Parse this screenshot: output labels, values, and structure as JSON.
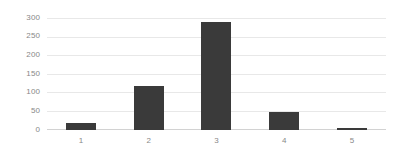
{
  "chart_data": {
    "type": "bar",
    "title": "",
    "subtitle": "",
    "xlabel": "",
    "ylabel": "",
    "categories": [
      "1",
      "2",
      "3",
      "4",
      "5"
    ],
    "values": [
      18,
      120,
      292,
      48,
      5
    ],
    "series": [
      {
        "name": "",
        "values": [
          18,
          120,
          292,
          48,
          5
        ]
      }
    ],
    "ylim": [
      0,
      300
    ],
    "yticks": [
      0,
      50,
      100,
      150,
      200,
      250,
      300
    ],
    "ytick_labels": [
      "0",
      "50",
      "100",
      "150",
      "200",
      "250",
      "300"
    ],
    "xtick_labels": [
      "1",
      "2",
      "3",
      "4",
      "5"
    ],
    "grid": true,
    "grid_axis": "y",
    "legend": false,
    "legend_position": "none",
    "annotations": [],
    "colors": {
      "bar": "#3a3a3a",
      "gridline": "#e8e8e8",
      "baseline": "#d2d2d2",
      "tick_label": "#888888",
      "background": "#ffffff"
    }
  }
}
